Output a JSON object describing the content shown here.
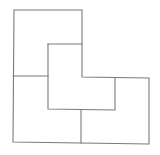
{
  "diagram": {
    "type": "tiling-puzzle",
    "stroke_color": "#7a7a7a",
    "background": "#ffffff",
    "pieces": [
      {
        "id": "top-left",
        "shape": "L"
      },
      {
        "id": "center",
        "shape": "L"
      },
      {
        "id": "bottom-left",
        "shape": "L"
      },
      {
        "id": "bottom-right",
        "shape": "L"
      }
    ]
  }
}
